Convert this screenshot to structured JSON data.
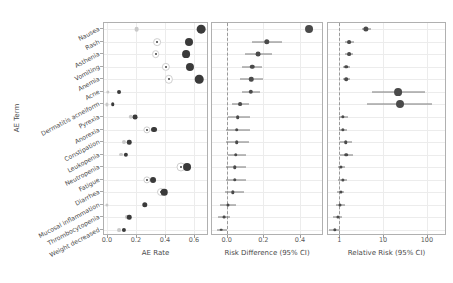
{
  "figure": {
    "yaxis_title": "AE Term",
    "terms": [
      "Nausea",
      "Rash",
      "Asthenia",
      "Vomiting",
      "Anemia",
      "Acne",
      "Dermatitis acneiform",
      "Pyrexia",
      "Anorexia",
      "Constipation",
      "Leukopenia",
      "Neutropenia",
      "Fatigue",
      "Diarrhea",
      "Mucosal inflammation",
      "Thrombocytopenia",
      "Weight decreased"
    ],
    "colors": {
      "treatment": "#3a3a3a",
      "control": "#c9c9c9",
      "ci_line": "#7a7a7a",
      "grid": "#ececec",
      "axis": "#b0b0b0",
      "text": "#4a4a4a"
    }
  },
  "chart_data": [
    {
      "type": "scatter",
      "panel": "AE Rate",
      "title": "",
      "xlabel": "AE Rate",
      "ylabel": "AE Term",
      "xlim": [
        -0.02,
        0.69
      ],
      "xticks": [
        0.0,
        0.2,
        0.4,
        0.6
      ],
      "xticklabels": [
        "0.0",
        "0.2",
        "0.4",
        "0.6"
      ],
      "grid": true,
      "legend": "",
      "categories": [
        "Nausea",
        "Rash",
        "Asthenia",
        "Vomiting",
        "Anemia",
        "Acne",
        "Dermatitis acneiform",
        "Pyrexia",
        "Anorexia",
        "Constipation",
        "Leukopenia",
        "Neutropenia",
        "Fatigue",
        "Diarrhea",
        "Mucosal inflammation",
        "Thrombocytopenia",
        "Weight decreased"
      ],
      "series": [
        {
          "name": "Control",
          "values": [
            0.205,
            0.345,
            0.335,
            0.405,
            0.425,
            0.005,
            0.0,
            0.165,
            0.275,
            0.115,
            0.095,
            0.51,
            0.275,
            0.375,
            0.0,
            0.14,
            0.085
          ]
        },
        {
          "name": "Treatment",
          "values": [
            0.65,
            0.565,
            0.545,
            0.575,
            0.635,
            0.085,
            0.04,
            0.195,
            0.325,
            0.155,
            0.13,
            0.555,
            0.32,
            0.395,
            0.26,
            0.155,
            0.115
          ]
        }
      ]
    },
    {
      "type": "scatter",
      "panel": "Risk Difference",
      "title": "",
      "xlabel": "Risk Difference (95% CI)",
      "ylabel": "",
      "xlim": [
        -0.08,
        0.52
      ],
      "xticks": [
        0.0,
        0.2,
        0.4
      ],
      "xticklabels": [
        "0.0",
        "0.2",
        "0.4"
      ],
      "reference_line": 0.0,
      "grid": true,
      "categories": [
        "Nausea",
        "Rash",
        "Asthenia",
        "Vomiting",
        "Anemia",
        "Acne",
        "Dermatitis acneiform",
        "Pyrexia",
        "Anorexia",
        "Constipation",
        "Leukopenia",
        "Neutropenia",
        "Fatigue",
        "Diarrhea",
        "Mucosal inflammation",
        "Thrombocytopenia",
        "Weight decreased"
      ],
      "estimates": [
        0.45,
        0.22,
        0.17,
        0.14,
        0.135,
        0.13,
        0.075,
        0.06,
        0.055,
        0.055,
        0.05,
        0.045,
        0.045,
        0.035,
        0.005,
        -0.015,
        -0.03
      ],
      "ci_low": [
        0.43,
        0.14,
        0.1,
        0.085,
        0.07,
        0.085,
        0.03,
        0.005,
        -0.005,
        -0.005,
        0.005,
        -0.005,
        -0.005,
        -0.01,
        -0.035,
        -0.05,
        -0.055
      ],
      "ci_high": [
        0.47,
        0.3,
        0.245,
        0.195,
        0.2,
        0.18,
        0.12,
        0.13,
        0.125,
        0.12,
        0.105,
        0.105,
        0.105,
        0.095,
        0.05,
        0.02,
        0.0
      ]
    },
    {
      "type": "scatter",
      "panel": "Relative Risk",
      "title": "",
      "xlabel": "Relative Risk (95% CI)",
      "ylabel": "",
      "xscale": "log",
      "xlim": [
        0.55,
        260
      ],
      "xticks": [
        1,
        10,
        100
      ],
      "xticklabels": [
        "1",
        "10",
        "100"
      ],
      "reference_line": 1.0,
      "grid": true,
      "categories": [
        "Nausea",
        "Rash",
        "Asthenia",
        "Vomiting",
        "Anemia",
        "Acne",
        "Dermatitis acneiform",
        "Pyrexia",
        "Anorexia",
        "Constipation",
        "Leukopenia",
        "Neutropenia",
        "Fatigue",
        "Diarrhea",
        "Mucosal inflammation",
        "Thrombocytopenia",
        "Weight decreased"
      ],
      "estimates": [
        4.1,
        1.7,
        1.65,
        1.45,
        1.45,
        22.0,
        24.0,
        1.22,
        1.2,
        1.4,
        1.45,
        1.1,
        1.18,
        1.08,
        1.05,
        0.92,
        0.8
      ],
      "ci_low": [
        3.3,
        1.35,
        1.35,
        1.22,
        1.22,
        5.5,
        4.3,
        0.98,
        0.97,
        1.05,
        1.05,
        0.92,
        0.95,
        0.9,
        0.82,
        0.72,
        0.58
      ],
      "ci_high": [
        5.2,
        2.15,
        2.05,
        1.75,
        1.75,
        92.0,
        130.0,
        1.55,
        1.5,
        1.9,
        2.0,
        1.35,
        1.48,
        1.3,
        1.35,
        1.18,
        1.05
      ]
    }
  ]
}
